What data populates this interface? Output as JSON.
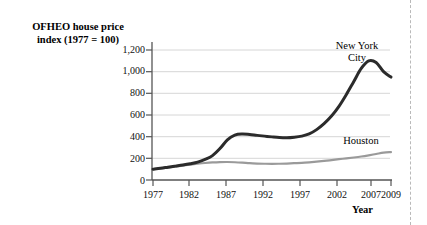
{
  "chart_data": {
    "type": "line",
    "title": "OFHEO house price index (1977 = 100)",
    "title_line1": "OFHEO house price",
    "title_line2": "index (1977 = 100)",
    "xlabel": "Year",
    "ylabel": "OFHEO house price index (1977 = 100)",
    "xlim": [
      1977,
      2009
    ],
    "ylim": [
      0,
      1200
    ],
    "grid": true,
    "legend_position": "inline-annotations",
    "xticks": [
      "1977",
      "1982",
      "1987",
      "1992",
      "1997",
      "2002",
      "2007",
      "2009"
    ],
    "xtick_values": [
      1977,
      1982,
      1987,
      1992,
      1997,
      2002,
      2007,
      2009
    ],
    "yticks": [
      "0",
      "200",
      "400",
      "600",
      "800",
      "1,000",
      "1,200"
    ],
    "ytick_values": [
      0,
      200,
      400,
      600,
      800,
      1000,
      1200
    ],
    "x": [
      1977,
      1978,
      1979,
      1980,
      1981,
      1982,
      1983,
      1984,
      1985,
      1986,
      1987,
      1988,
      1989,
      1990,
      1991,
      1992,
      1993,
      1994,
      1995,
      1996,
      1997,
      1998,
      1999,
      2000,
      2001,
      2002,
      2003,
      2004,
      2005,
      2006,
      2007,
      2008,
      2009
    ],
    "series": [
      {
        "name": "New York City",
        "color": "#2b2b2b",
        "width": 3.0,
        "values": [
          100,
          108,
          118,
          128,
          138,
          150,
          165,
          190,
          225,
          290,
          370,
          415,
          425,
          420,
          412,
          405,
          398,
          392,
          390,
          395,
          405,
          425,
          465,
          520,
          590,
          680,
          790,
          910,
          1030,
          1100,
          1085,
          1000,
          950
        ]
      },
      {
        "name": "Houston",
        "color": "#9a9a9a",
        "width": 2.2,
        "values": [
          100,
          107,
          115,
          124,
          133,
          142,
          150,
          157,
          162,
          165,
          166,
          164,
          160,
          155,
          152,
          150,
          149,
          150,
          152,
          155,
          158,
          163,
          169,
          176,
          184,
          192,
          200,
          208,
          217,
          228,
          240,
          252,
          258
        ]
      }
    ],
    "annotations": [
      {
        "text": "New York City",
        "line1": "New York",
        "line2": "City",
        "series": "New York City"
      },
      {
        "text": "Houston",
        "series": "Houston"
      }
    ]
  }
}
